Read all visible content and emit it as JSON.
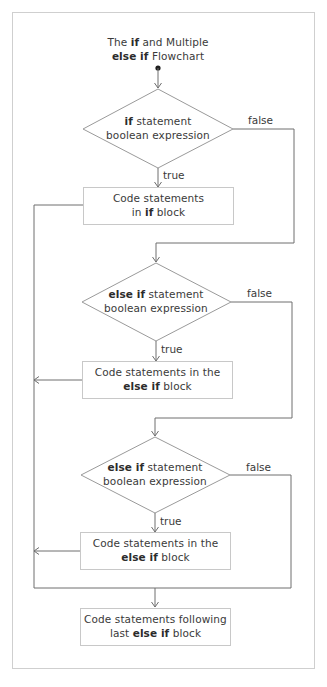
{
  "title": {
    "line1": [
      {
        "text": "The ",
        "bold": false
      },
      {
        "text": "if",
        "bold": true
      },
      {
        "text": " and Multiple",
        "bold": false
      }
    ],
    "line2": [
      {
        "text": "else if",
        "bold": true
      },
      {
        "text": " Flowchart",
        "bold": false
      }
    ]
  },
  "nodes": {
    "decision_if": {
      "line1": [
        {
          "text": "if",
          "bold": true
        },
        {
          "text": " statement",
          "bold": false
        }
      ],
      "line2": [
        {
          "text": "boolean expression",
          "bold": false
        }
      ]
    },
    "block_if": {
      "line1": [
        {
          "text": "Code statements",
          "bold": false
        }
      ],
      "line2": [
        {
          "text": "in ",
          "bold": false
        },
        {
          "text": "if",
          "bold": true
        },
        {
          "text": " block",
          "bold": false
        }
      ]
    },
    "decision_elseif_1": {
      "line1": [
        {
          "text": "else if",
          "bold": true
        },
        {
          "text": " statement",
          "bold": false
        }
      ],
      "line2": [
        {
          "text": "boolean expression",
          "bold": false
        }
      ]
    },
    "block_elseif_1": {
      "line1": [
        {
          "text": "Code statements in the",
          "bold": false
        }
      ],
      "line2": [
        {
          "text": "else if",
          "bold": true
        },
        {
          "text": " block",
          "bold": false
        }
      ]
    },
    "decision_elseif_2": {
      "line1": [
        {
          "text": "else if",
          "bold": true
        },
        {
          "text": " statement",
          "bold": false
        }
      ],
      "line2": [
        {
          "text": "boolean expression",
          "bold": false
        }
      ]
    },
    "block_elseif_2": {
      "line1": [
        {
          "text": "Code statements in the",
          "bold": false
        }
      ],
      "line2": [
        {
          "text": "else if",
          "bold": true
        },
        {
          "text": " block",
          "bold": false
        }
      ]
    },
    "block_following": {
      "line1": [
        {
          "text": "Code statements following",
          "bold": false
        }
      ],
      "line2": [
        {
          "text": "last ",
          "bold": false
        },
        {
          "text": "else if",
          "bold": true
        },
        {
          "text": " block",
          "bold": false
        }
      ]
    }
  },
  "edge_labels": {
    "true": "true",
    "false": "false"
  },
  "colors": {
    "line": "#6e6e6e",
    "box_border": "#c8c8c8",
    "frame_border": "#cfcfcf",
    "text": "#3a3a3a"
  }
}
